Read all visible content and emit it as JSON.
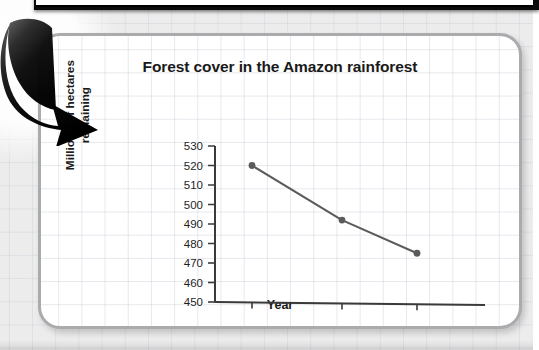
{
  "chart_data": {
    "type": "line",
    "title": "Forest cover in the Amazon rainforest",
    "xlabel": "Year",
    "ylabel": "Millions of hectares remaining",
    "ylabel_line1": "Millions of hectares",
    "ylabel_line2": "remaining",
    "categories": [
      "1990",
      "2000",
      "2005"
    ],
    "x": [
      1990,
      2000,
      2005
    ],
    "values": [
      520,
      492,
      475
    ],
    "xtick_labels": [
      "1990",
      "2000",
      "2005"
    ],
    "ytick_labels": [
      "530",
      "520",
      "510",
      "500",
      "490",
      "480",
      "470",
      "460",
      "450"
    ],
    "yticks": [
      530,
      520,
      510,
      500,
      490,
      480,
      470,
      460,
      450
    ],
    "ylim": [
      450,
      530
    ],
    "xlim": [
      1985,
      2010
    ],
    "grid": false,
    "legend": "none",
    "series": [
      {
        "name": "Forest cover",
        "values": [
          520,
          492,
          475
        ],
        "marker": "circle",
        "color": "#5b5b5b"
      }
    ]
  },
  "figure": {
    "panel_border_color": "#a9abad",
    "page_background": "#ececed",
    "grid_color": "#aab4c3",
    "line_color": "#5b5b5b",
    "axis_color": "#3a3a3a",
    "text_color": "#1a1a1a"
  },
  "decoration": {
    "arrow_icon": "curved-arrow-down-right",
    "arrow_color": "#111111",
    "top_frame_color": "#0b0b0b"
  }
}
